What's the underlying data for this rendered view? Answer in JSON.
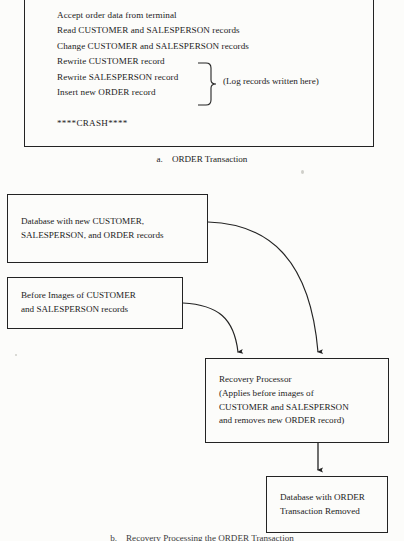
{
  "figure": {
    "part_a": {
      "caption_letter": "a.",
      "caption_text": "ORDER Transaction",
      "lines": [
        "Accept order data from terminal",
        "Read CUSTOMER and SALESPERSON records",
        "Change CUSTOMER and SALESPERSON records",
        "Rewrite CUSTOMER record",
        "Rewrite SALESPERSON record",
        "Insert new ORDER record"
      ],
      "brace_note": "(Log records written here)",
      "crash_marker": "****CRASH****"
    },
    "part_b": {
      "caption_letter": "b.",
      "caption_text": "Recovery Processing the ORDER Transaction",
      "boxes": {
        "new_database": {
          "line1": "Database with new CUSTOMER,",
          "line2": "SALESPERSON, and ORDER records"
        },
        "before_images": {
          "line1": "Before Images of CUSTOMER",
          "line2": "and SALESPERSON records"
        },
        "recovery_processor": {
          "line1": "Recovery Processor",
          "line2": "(Applies before images of",
          "line3": "CUSTOMER and SALESPERSON",
          "line4": "and removes new ORDER record)"
        },
        "result_database": {
          "line1": "Database with ORDER",
          "line2": "Transaction Removed"
        }
      }
    }
  },
  "colors": {
    "ink": "#232323",
    "paper": "#fcfcfa"
  }
}
